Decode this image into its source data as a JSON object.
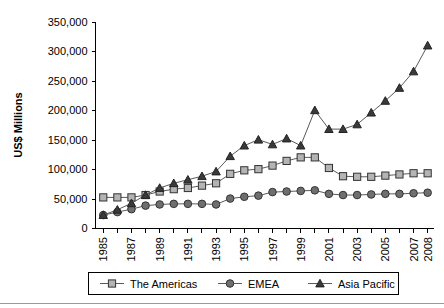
{
  "chart_data": {
    "type": "line",
    "title": "",
    "xlabel": "",
    "ylabel": "US$ Millions",
    "ylim": [
      0,
      350000
    ],
    "ytick_values": [
      0,
      50000,
      100000,
      150000,
      200000,
      250000,
      300000,
      350000
    ],
    "ytick_labels": [
      "0",
      "50,000",
      "100,000",
      "150,000",
      "200,000",
      "250,000",
      "300,000",
      "350,000"
    ],
    "grid": false,
    "legend_position": "bottom",
    "x": [
      1985,
      1986,
      1987,
      1988,
      1989,
      1990,
      1991,
      1992,
      1993,
      1994,
      1995,
      1996,
      1997,
      1998,
      1999,
      2000,
      2001,
      2002,
      2003,
      2004,
      2005,
      2006,
      2007,
      2008
    ],
    "xtick_labels": [
      "1985",
      "",
      "1987",
      "",
      "1989",
      "",
      "1991",
      "",
      "1993",
      "",
      "1995",
      "",
      "1997",
      "",
      "1999",
      "",
      "2001",
      "",
      "2003",
      "",
      "2005",
      "",
      "2007",
      "2008"
    ],
    "series": [
      {
        "name": "The Americas",
        "marker": "square",
        "color": "#b4b4b4",
        "values": [
          52000,
          52000,
          52000,
          56000,
          62000,
          66000,
          68000,
          72000,
          76000,
          92000,
          98000,
          100000,
          106000,
          114000,
          120000,
          120000,
          102000,
          88000,
          87000,
          87000,
          89000,
          91000,
          93000,
          93000
        ]
      },
      {
        "name": "EMEA",
        "marker": "circle",
        "color": "#6f6f6f",
        "values": [
          22000,
          27000,
          32000,
          38000,
          40000,
          41000,
          41000,
          41000,
          40000,
          50000,
          53000,
          55000,
          61000,
          62000,
          63000,
          64000,
          58000,
          56000,
          56000,
          57000,
          58000,
          58000,
          59000,
          60000
        ]
      },
      {
        "name": "Asia Pacific",
        "marker": "triangle",
        "color": "#3a3a3a",
        "values": [
          22000,
          31000,
          42000,
          56000,
          68000,
          76000,
          82000,
          88000,
          96000,
          122000,
          140000,
          150000,
          142000,
          152000,
          140000,
          200000,
          168000,
          168000,
          176000,
          196000,
          216000,
          238000,
          266000,
          288000
        ]
      }
    ],
    "final_point": {
      "name": "Asia Pacific",
      "x": 2008,
      "value": 310000
    }
  },
  "legend": {
    "items": [
      {
        "label": "The Americas",
        "marker": "square"
      },
      {
        "label": "EMEA",
        "marker": "circle"
      },
      {
        "label": "Asia Pacific",
        "marker": "triangle"
      }
    ]
  }
}
